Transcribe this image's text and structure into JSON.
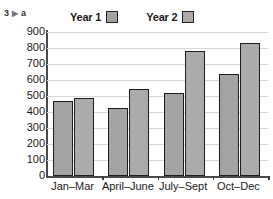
{
  "exercise": {
    "number": "3",
    "arrow": "▶",
    "part": "a"
  },
  "chart_data": {
    "type": "bar",
    "title": "",
    "xlabel": "",
    "ylabel": "",
    "categories": [
      "Jan–Mar",
      "April–June",
      "July–Sept",
      "Oct–Dec"
    ],
    "series": [
      {
        "name": "Year 1",
        "values": [
          470,
          425,
          520,
          640
        ],
        "color": "#a3a3a3"
      },
      {
        "name": "Year 2",
        "values": [
          490,
          545,
          780,
          830
        ],
        "color": "#ababab"
      }
    ],
    "ylim": [
      0,
      900
    ],
    "ytick_step": 100,
    "yticks": [
      "900",
      "800",
      "700",
      "600",
      "500",
      "400",
      "300",
      "200",
      "100",
      "0"
    ],
    "grid": true,
    "legend_position": "top"
  },
  "axis": {
    "tick_labels": [
      "900",
      "800",
      "700",
      "600",
      "500",
      "400",
      "300",
      "200",
      "100",
      "0"
    ]
  },
  "legend": {
    "entries": [
      {
        "label": "Year 1",
        "swatch_color": "#a3a3a3"
      },
      {
        "label": "Year 2",
        "swatch_color": "#ababab"
      }
    ]
  },
  "footer": {
    "cut_text": ""
  }
}
